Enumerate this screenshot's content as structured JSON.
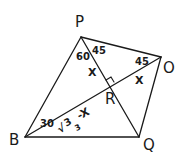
{
  "diagram": {
    "type": "geometry-figure",
    "points": {
      "P": "P",
      "O": "O",
      "B": "B",
      "Q": "Q",
      "R": "R"
    },
    "segments": [
      "PB",
      "PO",
      "PQ",
      "BO",
      "BQ",
      "OQ"
    ],
    "right_angle_at": "R",
    "angle_labels": {
      "BPR": "60",
      "RPO": "45",
      "POR": "45",
      "PBR": "30"
    },
    "length_labels": {
      "PR": "X",
      "RO": "X",
      "BR_radicand": "3",
      "BR_denominator": "3",
      "BR_suffix": "-X",
      "BR_root_symbol": "√"
    },
    "stroke_color": "#1a1a1a",
    "background": "#ffffff"
  }
}
